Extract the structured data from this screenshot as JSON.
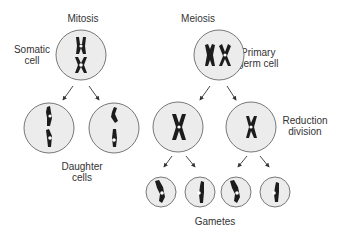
{
  "diagram": {
    "titles": {
      "mitosis": "Mitosis",
      "meiosis": "Meiosis"
    },
    "labels": {
      "somatic_cell": [
        "Somatic",
        "cell"
      ],
      "primary_germ_cell": [
        "Primary",
        "germ cell"
      ],
      "daughter_cells": [
        "Daughter",
        "cells"
      ],
      "reduction_division": [
        "Reduction",
        "division"
      ],
      "gametes": "Gametes"
    },
    "colors": {
      "cell_fill": "#ececec",
      "cell_stroke": "#777777",
      "chromosome": "#1c1c1c",
      "text": "#333333"
    }
  }
}
